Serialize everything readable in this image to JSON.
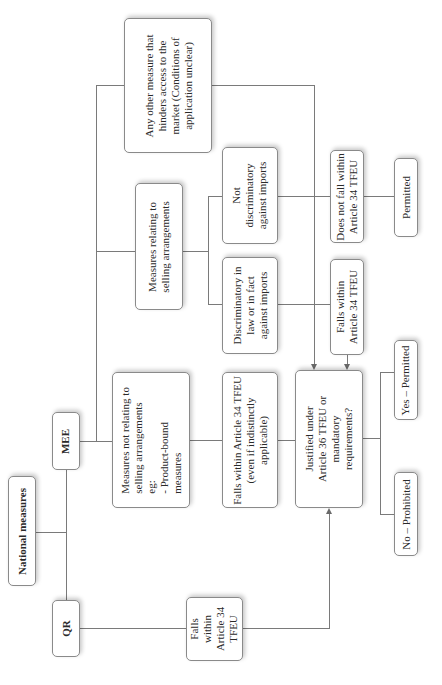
{
  "diagram": {
    "orientation": "rotated-90-ccw",
    "root": {
      "label": "National measures"
    },
    "branches": {
      "qr": {
        "label": "QR"
      },
      "mee": {
        "label": "MEE"
      }
    },
    "nodes": {
      "any_other_measure": {
        "label": "Any other measure that\nhinders access to the\nmarket (Conditions of\napplication unclear)"
      },
      "selling_arrangements": {
        "label": "Measures relating to\nselling  arrangements"
      },
      "not_selling_arrangements": {
        "label": "Measures not relating to\nselling arrangements\neg:\n- Product-bound\n   measures"
      },
      "not_discriminatory": {
        "label": "Not\ndiscriminatory\nagainst imports"
      },
      "discriminatory": {
        "label": "Discriminatory in\nlaw or in fact\nagainst imports"
      },
      "falls_within_indistinct": {
        "label": "Falls within Article 34 TFEU\n(even if indistinctly\napplicable)"
      },
      "does_not_fall_within": {
        "label": "Does not fall within\nArticle 34 TFEU"
      },
      "falls_within_discrim": {
        "label": "Falls within\nArticle 34 TFEU"
      },
      "permitted": {
        "label": "Permitted"
      },
      "justified": {
        "label": "Justified under\nArticle 36 TFEU or\nmandatory\nrequirements?"
      },
      "yes_permitted": {
        "label": "Yes – Permitted"
      },
      "no_prohibited": {
        "label": "No – Prohibited"
      },
      "qr_falls_within": {
        "label": "Falls\nwithin\nArticle 34\nTFEU"
      }
    },
    "edges": [
      [
        "National measures",
        "QR"
      ],
      [
        "National measures",
        "MEE"
      ],
      [
        "MEE",
        "Measures not relating to selling arrangements"
      ],
      [
        "MEE",
        "Measures relating to selling arrangements"
      ],
      [
        "MEE",
        "Any other measure that hinders access to the market"
      ],
      [
        "Measures relating to selling arrangements",
        "Not discriminatory against imports"
      ],
      [
        "Measures relating to selling arrangements",
        "Discriminatory in law or in fact against imports"
      ],
      [
        "Not discriminatory against imports",
        "Does not fall within Article 34 TFEU"
      ],
      [
        "Does not fall within Article 34 TFEU",
        "Permitted"
      ],
      [
        "Discriminatory in law or in fact against imports",
        "Falls within Article 34 TFEU"
      ],
      [
        "Falls within Article 34 TFEU",
        "Justified under Article 36 TFEU or mandatory requirements?"
      ],
      [
        "Any other measure that hinders access to the market",
        "Justified under Article 36 TFEU or mandatory requirements?"
      ],
      [
        "Measures not relating to selling arrangements",
        "Falls within Article 34 TFEU (even if indistinctly applicable)"
      ],
      [
        "Falls within Article 34 TFEU (even if indistinctly applicable)",
        "Justified under Article 36 TFEU or mandatory requirements?"
      ],
      [
        "QR",
        "Falls within Article 34 TFEU"
      ],
      [
        "Falls within Article 34 TFEU (QR)",
        "Justified under Article 36 TFEU or mandatory requirements?"
      ],
      [
        "Justified under Article 36 TFEU or mandatory requirements?",
        "Yes – Permitted"
      ],
      [
        "Justified under Article 36 TFEU or mandatory requirements?",
        "No – Prohibited"
      ]
    ]
  }
}
